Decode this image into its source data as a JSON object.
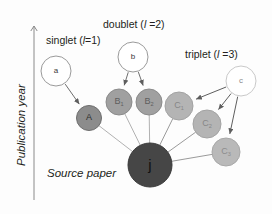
{
  "figure": {
    "background_color": "#fdfdfd",
    "axis": {
      "label": "Publication year",
      "arrow_color": "#8a8a8a",
      "x": 34,
      "top_y": 26,
      "bottom_y": 200
    },
    "class_labels": [
      {
        "name": "singlet-label",
        "prefix": "singlet (",
        "italic": "l",
        "suffix": "=1)",
        "x": 46,
        "y": 35
      },
      {
        "name": "doublet-label",
        "prefix": "doublet (",
        "italic": "l",
        "suffix": " =2)",
        "x": 103,
        "y": 19
      },
      {
        "name": "triplet-label",
        "prefix": "triplet (",
        "italic": "l",
        "suffix": " =3)",
        "x": 185,
        "y": 49
      }
    ],
    "source_label": {
      "text": "Source paper",
      "x": 47,
      "y": 168
    },
    "nodes": [
      {
        "id": "a",
        "label": "a",
        "sub": "",
        "cx": 56,
        "cy": 71,
        "r": 15,
        "fill": "#ffffff",
        "stroke": "#9a9a9a",
        "text_color": "#3a3a3a",
        "font_size": 8
      },
      {
        "id": "b",
        "label": "b",
        "sub": "",
        "cx": 133,
        "cy": 57,
        "r": 15,
        "fill": "#ffffff",
        "stroke": "#9a9a9a",
        "text_color": "#3a3a3a",
        "font_size": 8
      },
      {
        "id": "c",
        "label": "c",
        "sub": "",
        "cx": 241,
        "cy": 81,
        "r": 15,
        "fill": "#ffffff",
        "stroke": "#c9c9c9",
        "text_color": "#8a8a8a",
        "font_size": 8
      },
      {
        "id": "A",
        "label": "A",
        "sub": "",
        "cx": 89,
        "cy": 118,
        "r": 12.5,
        "fill": "#8c8c8c",
        "stroke": "#6e6e6e",
        "text_color": "#2b2b2b",
        "font_size": 9
      },
      {
        "id": "B1",
        "label": "B",
        "sub": "1",
        "cx": 119,
        "cy": 102,
        "r": 13,
        "fill": "#a0a0a0",
        "stroke": "#8b8b8b",
        "text_color": "#5e5e5e",
        "font_size": 9
      },
      {
        "id": "B2",
        "label": "B",
        "sub": "2",
        "cx": 149,
        "cy": 102,
        "r": 13,
        "fill": "#a0a0a0",
        "stroke": "#8b8b8b",
        "text_color": "#5e5e5e",
        "font_size": 9
      },
      {
        "id": "C1",
        "label": "C",
        "sub": "1",
        "cx": 179,
        "cy": 106,
        "r": 14,
        "fill": "#b4b4b4",
        "stroke": "#a3a3a3",
        "text_color": "#868686",
        "font_size": 9
      },
      {
        "id": "C2",
        "label": "C",
        "sub": "2",
        "cx": 207,
        "cy": 124,
        "r": 14,
        "fill": "#b4b4b4",
        "stroke": "#a3a3a3",
        "text_color": "#868686",
        "font_size": 9
      },
      {
        "id": "C3",
        "label": "C",
        "sub": "3",
        "cx": 226,
        "cy": 152,
        "r": 14,
        "fill": "#b9b9b9",
        "stroke": "#a8a8a8",
        "text_color": "#8c8c8c",
        "font_size": 9
      },
      {
        "id": "j",
        "label": "j",
        "sub": "",
        "cx": 150,
        "cy": 165,
        "r": 22,
        "fill": "#464646",
        "stroke": "#3a3a3a",
        "text_color": "#111111",
        "font_size": 15
      }
    ],
    "arrows": [
      {
        "name": "edge-a-to-A",
        "from": "a",
        "to": "A",
        "arrowhead": true,
        "color": "#6e6e6e"
      },
      {
        "name": "edge-b-to-B1",
        "from": "b",
        "to": "B1",
        "arrowhead": true,
        "color": "#6e6e6e"
      },
      {
        "name": "edge-b-to-B2",
        "from": "b",
        "to": "B2",
        "arrowhead": true,
        "color": "#6e6e6e"
      },
      {
        "name": "edge-c-to-C1",
        "from": "c",
        "to": "C1",
        "arrowhead": true,
        "color": "#5e5e5e"
      },
      {
        "name": "edge-c-to-C2",
        "from": "c",
        "to": "C2",
        "arrowhead": true,
        "color": "#5e5e5e"
      },
      {
        "name": "edge-c-to-C3",
        "from": "c",
        "to": "C3",
        "arrowhead": true,
        "color": "#5e5e5e"
      }
    ],
    "links": [
      {
        "name": "link-A-to-j",
        "from": "A",
        "to": "j",
        "color": "#a8a8a8"
      },
      {
        "name": "link-B1-to-j",
        "from": "B1",
        "to": "j",
        "color": "#a8a8a8"
      },
      {
        "name": "link-B2-to-j",
        "from": "B2",
        "to": "j",
        "color": "#a8a8a8"
      },
      {
        "name": "link-C1-to-j",
        "from": "C1",
        "to": "j",
        "color": "#8f8f8f"
      },
      {
        "name": "link-C2-to-j",
        "from": "C2",
        "to": "j",
        "color": "#8f8f8f"
      },
      {
        "name": "link-C3-to-j",
        "from": "C3",
        "to": "j",
        "color": "#8f8f8f"
      }
    ]
  }
}
